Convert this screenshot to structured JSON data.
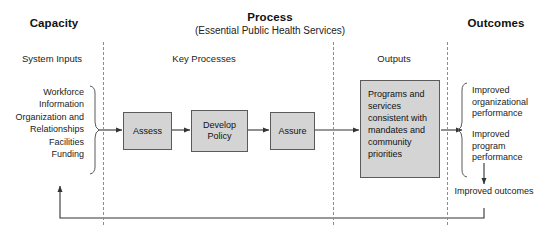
{
  "diagram": {
    "columns": {
      "capacity": {
        "heading": "Capacity",
        "section_label": "System Inputs",
        "items": [
          "Workforce",
          "Information",
          "Organization and Relationships",
          "Facilities",
          "Funding"
        ]
      },
      "process": {
        "heading": "Process",
        "subheading": "(Essential Public Health Services)",
        "section_label": "Key Processes",
        "steps": [
          "Assess",
          "Develop Policy",
          "Assure"
        ]
      },
      "outputs": {
        "section_label": "Outputs",
        "box_text": "Programs and services consistent with mandates and community priorities"
      },
      "outcomes": {
        "heading": "Outcomes",
        "items": [
          "Improved organizational performance",
          "Improved program performance"
        ],
        "final": "Improved outcomes"
      }
    },
    "colors": {
      "box_fill": "#d4d4d4",
      "box_border": "#5a5a5a",
      "line": "#333333",
      "divider": "#8e8e8e",
      "text": "#1a1a1a",
      "background": "#ffffff"
    }
  }
}
